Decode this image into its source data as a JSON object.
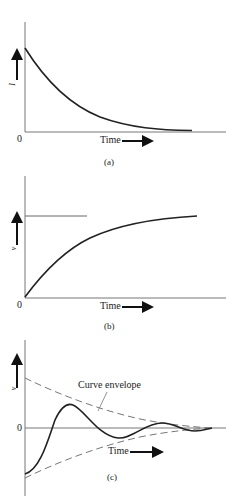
{
  "panels": [
    {
      "id": "a",
      "caption": "(a)",
      "y_label": "I",
      "origin_label": "0",
      "x_label": "Time",
      "description": "Exponential decay from initial value to zero"
    },
    {
      "id": "b",
      "caption": "(b)",
      "y_label": "v",
      "origin_label": "0",
      "x_label": "Time",
      "description": "Exponential rise from zero approaching asymptote"
    },
    {
      "id": "c",
      "caption": "(c)",
      "y_label": "v",
      "origin_label": "0",
      "x_label": "Time",
      "annotation": "Curve envelope",
      "description": "Damped oscillation within decaying dashed envelope"
    }
  ],
  "colors": {
    "curve": "#222222",
    "axis": "#666666",
    "envelope": "#777777"
  }
}
